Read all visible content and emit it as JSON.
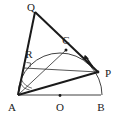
{
  "figure": {
    "background": "#ffffff",
    "ink": "#1a1a1a",
    "thin": "#3a3a3a"
  },
  "labels": {
    "Q": "Q",
    "R": "R",
    "C": "C",
    "P": "P",
    "A": "A",
    "O": "O",
    "B": "B"
  },
  "points": {
    "Q": {
      "x": 35,
      "y": 12
    },
    "R": {
      "x": 32,
      "y": 60
    },
    "C": {
      "x": 66,
      "y": 50
    },
    "P": {
      "x": 98,
      "y": 72
    },
    "A": {
      "x": 18,
      "y": 95
    },
    "O": {
      "x": 60,
      "y": 95
    },
    "B": {
      "x": 101,
      "y": 95
    }
  },
  "label_positions": {
    "Q": {
      "x": 32,
      "y": 10
    },
    "R": {
      "x": 29,
      "y": 57
    },
    "C": {
      "x": 63,
      "y": 44
    },
    "P": {
      "x": 104,
      "y": 76
    },
    "A": {
      "x": 10,
      "y": 110
    },
    "O": {
      "x": 56,
      "y": 110
    },
    "B": {
      "x": 97,
      "y": 110
    }
  },
  "dot_markers": [
    {
      "name": "point-C-dot",
      "x": 66,
      "y": 50
    },
    {
      "name": "point-O-dot",
      "x": 60,
      "y": 96
    },
    {
      "name": "point-P-dot",
      "x": 98,
      "y": 72
    }
  ],
  "arc": {
    "name": "circle-arc-A-C-B",
    "center": {
      "x": 60,
      "y": 95
    },
    "radius": 42,
    "from_deg": 180,
    "to_deg": 0
  },
  "motion_arrow": {
    "name": "arc-direction-arrow",
    "description": "arrow along arc near P indicating direction of travel",
    "from": {
      "x": 93,
      "y": 65
    },
    "to": {
      "x": 85,
      "y": 55
    }
  },
  "segments": [
    {
      "name": "segment-Q-A",
      "from": "Q",
      "to": "A",
      "weight": "thick"
    },
    {
      "name": "segment-Q-P",
      "from": "Q",
      "to": "P",
      "weight": "thick"
    },
    {
      "name": "segment-A-B",
      "from": "A",
      "to": "B",
      "weight": "thin"
    },
    {
      "name": "segment-A-P",
      "from": "A",
      "to": "P",
      "weight": "thick"
    },
    {
      "name": "segment-A-C",
      "from": "A",
      "to": "C",
      "weight": "thin"
    },
    {
      "name": "segment-R-P",
      "from": "R",
      "to": "P",
      "weight": "thin"
    }
  ],
  "angle_marks": [
    {
      "name": "angle-mark-at-A-inner",
      "vertex": "A",
      "radius": 11
    },
    {
      "name": "angle-mark-at-A-outer",
      "vertex": "A",
      "radius": 15
    },
    {
      "name": "right-angle-mark-at-R",
      "vertex": "R"
    }
  ]
}
